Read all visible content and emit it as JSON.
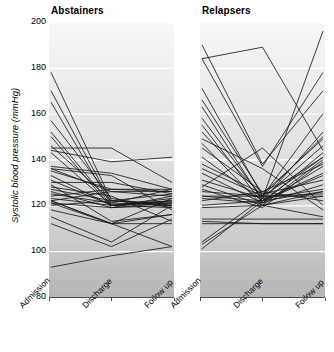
{
  "figure": {
    "ylabel": "Systolic blood pressure (mmHg)",
    "bg_top": "#f7f7f7",
    "bg_bottom": "#b5b5b5",
    "gridline_color": "#ffffff",
    "line_color": "#1a1a1a"
  },
  "axis": {
    "yticks": [
      200,
      180,
      160,
      140,
      120,
      100,
      80
    ],
    "ylim": [
      80,
      200
    ],
    "xticks": [
      "Admission",
      "Discharge",
      "Follow up"
    ]
  },
  "chart_data": {
    "type": "line",
    "title": "",
    "subtitle": "",
    "xlabel": "",
    "ylabel": "Systolic blood pressure (mmHg)",
    "ylim": [
      80,
      200
    ],
    "yticks": [
      80,
      100,
      120,
      140,
      160,
      180,
      200
    ],
    "grid": true,
    "legend_position": "none",
    "x": [
      "Admission",
      "Discharge",
      "Follow up"
    ],
    "panels": [
      {
        "name": "Abstainers",
        "title": "Abstainers",
        "series": [
          {
            "name": "s1",
            "values": [
              178,
              122,
              125
            ]
          },
          {
            "name": "s2",
            "values": [
              170,
              121,
              120
            ]
          },
          {
            "name": "s3",
            "values": [
              165,
              120,
              122
            ]
          },
          {
            "name": "s4",
            "values": [
              157,
              123,
              119
            ]
          },
          {
            "name": "s5",
            "values": [
              152,
              120,
              121
            ]
          },
          {
            "name": "s6",
            "values": [
              150,
              119,
              124
            ]
          },
          {
            "name": "s7",
            "values": [
              146,
              122,
              120
            ]
          },
          {
            "name": "s8",
            "values": [
              145,
              145,
              130
            ]
          },
          {
            "name": "s9",
            "values": [
              144,
              139,
              141
            ]
          },
          {
            "name": "s10",
            "values": [
              143,
              120,
              123
            ]
          },
          {
            "name": "s11",
            "values": [
              137,
              134,
              127
            ]
          },
          {
            "name": "s12",
            "values": [
              136,
              126,
              126
            ]
          },
          {
            "name": "s13",
            "values": [
              135,
              127,
              127
            ]
          },
          {
            "name": "s14",
            "values": [
              133,
              120,
              122
            ]
          },
          {
            "name": "s15",
            "values": [
              130,
              130,
              125
            ]
          },
          {
            "name": "s16",
            "values": [
              129,
              113,
              116
            ]
          },
          {
            "name": "s17",
            "values": [
              127,
              122,
              121
            ]
          },
          {
            "name": "s18",
            "values": [
              126,
              119,
              120
            ]
          },
          {
            "name": "s19",
            "values": [
              125,
              121,
              127
            ]
          },
          {
            "name": "s20",
            "values": [
              124,
              127,
              126
            ]
          },
          {
            "name": "s21",
            "values": [
              123,
              120,
              119
            ]
          },
          {
            "name": "s22",
            "values": [
              122,
              112,
              112
            ]
          },
          {
            "name": "s23",
            "values": [
              122,
              126,
              124
            ]
          },
          {
            "name": "s24",
            "values": [
              121,
              119,
              121
            ]
          },
          {
            "name": "s25",
            "values": [
              121,
              112,
              123
            ]
          },
          {
            "name": "s26",
            "values": [
              120,
              122,
              120
            ]
          },
          {
            "name": "s27",
            "values": [
              118,
              112,
              116
            ]
          },
          {
            "name": "s28",
            "values": [
              115,
              104,
              120
            ]
          },
          {
            "name": "s29",
            "values": [
              112,
              102,
              114
            ]
          },
          {
            "name": "s30",
            "values": [
              136,
              133,
              118
            ]
          },
          {
            "name": "s31",
            "values": [
              131,
              120,
              122
            ]
          },
          {
            "name": "s32",
            "values": [
              128,
              124,
              113
            ]
          },
          {
            "name": "s33",
            "values": [
              93,
              98,
              102
            ]
          },
          {
            "name": "s34",
            "values": [
              122,
              112,
              102
            ]
          }
        ]
      },
      {
        "name": "Relapsers",
        "title": "Relapsers",
        "series": [
          {
            "name": "r1",
            "values": [
              190,
              138,
              170
            ]
          },
          {
            "name": "r2",
            "values": [
              184,
              189,
              144
            ]
          },
          {
            "name": "r3",
            "values": [
              184,
              137,
              178
            ]
          },
          {
            "name": "r4",
            "values": [
              171,
              124,
              160
            ]
          },
          {
            "name": "r5",
            "values": [
              166,
              125,
              149
            ]
          },
          {
            "name": "r6",
            "values": [
              163,
              122,
              152
            ]
          },
          {
            "name": "r7",
            "values": [
              158,
              123,
              146
            ]
          },
          {
            "name": "r8",
            "values": [
              155,
              121,
              143
            ]
          },
          {
            "name": "r9",
            "values": [
              152,
              124,
              141
            ]
          },
          {
            "name": "r10",
            "values": [
              147,
              120,
              140
            ]
          },
          {
            "name": "r11",
            "values": [
              145,
              126,
              138
            ]
          },
          {
            "name": "r12",
            "values": [
              141,
              122,
              134
            ]
          },
          {
            "name": "r13",
            "values": [
              138,
              125,
              131
            ]
          },
          {
            "name": "r14",
            "values": [
              134,
              121,
              129
            ]
          },
          {
            "name": "r15",
            "values": [
              131,
              123,
              127
            ]
          },
          {
            "name": "r16",
            "values": [
              129,
              120,
              126
            ]
          },
          {
            "name": "r17",
            "values": [
              126,
              124,
              125
            ]
          },
          {
            "name": "r18",
            "values": [
              124,
              124,
              124
            ]
          },
          {
            "name": "r19",
            "values": [
              124,
              122,
              133
            ]
          },
          {
            "name": "r20",
            "values": [
              123,
              121,
              137
            ]
          },
          {
            "name": "r21",
            "values": [
              122,
              126,
              122
            ]
          },
          {
            "name": "r22",
            "values": [
              120,
              122,
              126
            ]
          },
          {
            "name": "r23",
            "values": [
              119,
              120,
              115
            ]
          },
          {
            "name": "r24",
            "values": [
              114,
              114,
              114
            ]
          },
          {
            "name": "r25",
            "values": [
              113,
              112,
              112
            ]
          },
          {
            "name": "r26",
            "values": [
              112,
              112,
              112
            ]
          },
          {
            "name": "r27",
            "values": [
              104,
              123,
              196
            ]
          },
          {
            "name": "r28",
            "values": [
              101,
              122,
              141
            ]
          },
          {
            "name": "r29",
            "values": [
              103,
              120,
              124
            ]
          },
          {
            "name": "r30",
            "values": [
              128,
              145,
              120
            ]
          },
          {
            "name": "r31",
            "values": [
              149,
              136,
              118
            ]
          },
          {
            "name": "r32",
            "values": [
              136,
              124,
              150
            ]
          },
          {
            "name": "r33",
            "values": [
              127,
              119,
              139
            ]
          }
        ]
      }
    ]
  }
}
